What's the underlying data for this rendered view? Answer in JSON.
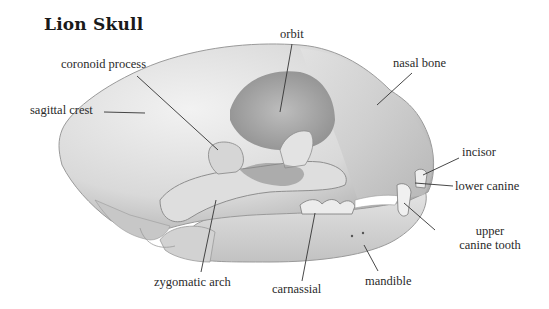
{
  "title": "Lion Skull",
  "labels": {
    "orbit": "orbit",
    "coronoid_process": "coronoid process",
    "nasal_bone": "nasal bone",
    "sagittal_crest": "sagittal crest",
    "incisor": "incisor",
    "lower_canine": "lower canine",
    "upper_canine_line1": "upper",
    "upper_canine_line2": "canine tooth",
    "zygomatic_arch": "zygomatic arch",
    "carnassial": "carnassial",
    "mandible": "mandible"
  },
  "colors": {
    "bone_light": "#e6e6e6",
    "bone_mid": "#cfcfcf",
    "bone_dark": "#a9a9a9",
    "leader_line": "#333333",
    "text": "#2a2a2a"
  }
}
